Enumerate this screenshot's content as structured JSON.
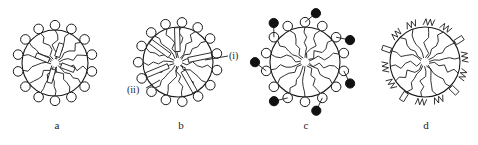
{
  "figure": {
    "colors": {
      "ink": "#1a1a1a",
      "filled_head": "#111111",
      "background": "#ffffff"
    }
  },
  "panels": [
    {
      "id": "a",
      "label": "a",
      "center": [
        55,
        63
      ],
      "radius": 33,
      "heads": 14,
      "head_style": "open-circle",
      "rods": 4,
      "annotations": []
    },
    {
      "id": "b",
      "label": "b",
      "center": [
        178,
        62
      ],
      "radius": 35,
      "heads": 15,
      "head_style": "open-circle",
      "rods": 5,
      "annotations": [
        {
          "text": "(i)",
          "target": "rod"
        },
        {
          "text": "(ii)",
          "target": "head-group"
        }
      ]
    },
    {
      "id": "c",
      "label": "c",
      "center": [
        305,
        62
      ],
      "radius": 35,
      "heads": 14,
      "head_style": "open-circle-with-filled-pendant",
      "rods": 0,
      "annotations": []
    },
    {
      "id": "d",
      "label": "d",
      "center": [
        425,
        62
      ],
      "radius": 35,
      "heads": 14,
      "head_style": "zigzag-chain-and-block",
      "rods": 0,
      "annotations": []
    }
  ],
  "labels": {
    "a": "a",
    "b": "b",
    "c": "c",
    "d": "d",
    "b_i": "(i)",
    "b_ii": "(ii)"
  }
}
